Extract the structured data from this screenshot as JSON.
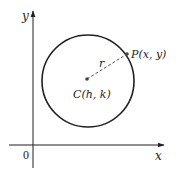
{
  "diagram": {
    "type": "circle-on-coordinate-plane",
    "axes": {
      "x_label": "x",
      "y_label": "y",
      "origin_label": "0"
    },
    "circle": {
      "center_label": "C(h, k)",
      "point_label": "P(x, y)",
      "radius_label": "r"
    },
    "colors": {
      "stroke": "#231f20",
      "axis": "#231f20",
      "background": "#ffffff"
    }
  }
}
